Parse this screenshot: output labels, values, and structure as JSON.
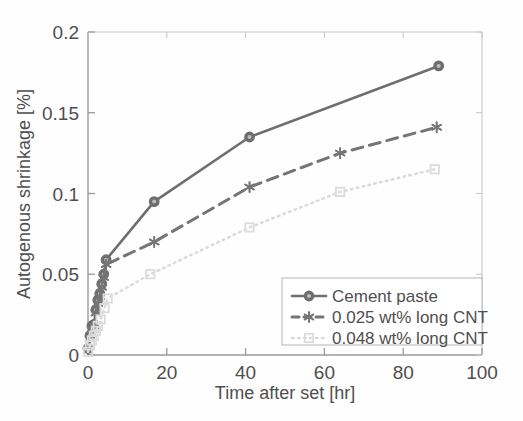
{
  "chart_data": {
    "type": "line",
    "title": "",
    "xlabel": "Time after set [hr]",
    "ylabel": "Autogenous shrinkage [%]",
    "xlim": [
      0,
      100
    ],
    "ylim": [
      0,
      0.2
    ],
    "xticks": [
      0,
      20,
      40,
      60,
      80,
      100
    ],
    "yticks": [
      0,
      0.05,
      0.1,
      0.15,
      0.2
    ],
    "xtick_labels": [
      "0",
      "20",
      "40",
      "60",
      "80",
      "100"
    ],
    "ytick_labels": [
      "0",
      "0.05",
      "0.1",
      "0.15",
      "0.2"
    ],
    "grid": false,
    "legend_position": "lower right",
    "series": [
      {
        "name": "Cement paste",
        "marker": "filled-circle",
        "linestyle": "solid",
        "color": "#6e6e6e",
        "x": [
          0,
          0.5,
          1.0,
          1.5,
          2.0,
          2.5,
          3.0,
          3.5,
          4.0,
          4.6,
          16.8,
          41.0,
          89.0
        ],
        "y": [
          0.004,
          0.012,
          0.018,
          0.019,
          0.028,
          0.034,
          0.038,
          0.044,
          0.05,
          0.059,
          0.095,
          0.135,
          0.179
        ]
      },
      {
        "name": "0.025 wt% long CNT",
        "marker": "star",
        "linestyle": "dashed",
        "color": "#757575",
        "x": [
          0,
          0.5,
          1.0,
          1.5,
          2.0,
          2.5,
          3.0,
          3.5,
          4.0,
          4.6,
          16.8,
          41.0,
          64.0,
          88.5
        ],
        "y": [
          0.003,
          0.01,
          0.016,
          0.018,
          0.026,
          0.032,
          0.036,
          0.042,
          0.048,
          0.056,
          0.07,
          0.104,
          0.125,
          0.141
        ]
      },
      {
        "name": "0.048 wt% long CNT",
        "marker": "open-square",
        "linestyle": "dotted",
        "color": "#dcdcdc",
        "x": [
          0,
          0.5,
          1.0,
          1.5,
          2.0,
          2.5,
          3.2,
          4.2,
          5.0,
          15.8,
          41.0,
          64.0,
          88.0
        ],
        "y": [
          0.002,
          0.006,
          0.009,
          0.012,
          0.015,
          0.018,
          0.022,
          0.029,
          0.035,
          0.05,
          0.079,
          0.101,
          0.115
        ]
      }
    ]
  },
  "axes": {
    "xlabel": "Time after set [hr]",
    "ylabel": "Autogenous shrinkage [%]"
  },
  "legend": {
    "entries": [
      {
        "label": "Cement paste"
      },
      {
        "label": "0.025 wt% long CNT"
      },
      {
        "label": "0.048 wt% long CNT"
      }
    ]
  }
}
